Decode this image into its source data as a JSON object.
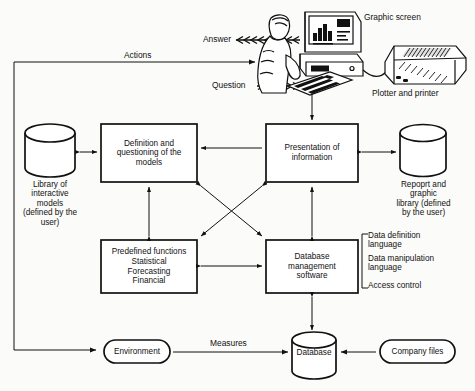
{
  "diagram": {
    "background_color": "#fbfbf9",
    "line_color": "#1a1a1a",
    "boxes": [
      {
        "id": "definition",
        "label": "Definition and\nquestioning of the\nmodels"
      },
      {
        "id": "presentation",
        "label": "Presentation of\ninformation"
      },
      {
        "id": "predefined",
        "label": "Predefined functions\nStatistical\nForecasting\nFinancial"
      },
      {
        "id": "dbms",
        "label": "Database\nmanagement\nsoftware"
      }
    ],
    "cylinders": [
      {
        "id": "model-library",
        "label": "Library of\ninteractive\nmodels\n(defined by the\nuser)"
      },
      {
        "id": "report-library",
        "label": "Repoprt and\ngraphic\nlibrary (defined\nby the user)"
      },
      {
        "id": "database",
        "label": "Database"
      }
    ],
    "rounded_nodes": [
      {
        "id": "environment",
        "label": "Environment"
      },
      {
        "id": "company-files",
        "label": "Company files"
      }
    ],
    "edge_labels": [
      {
        "id": "actions",
        "label": "Actions"
      },
      {
        "id": "answer",
        "label": "Answer"
      },
      {
        "id": "question",
        "label": "Question"
      },
      {
        "id": "measures",
        "label": "Measures"
      }
    ],
    "illustration_labels": [
      {
        "id": "graphic-screen",
        "label": "Graphic screen"
      },
      {
        "id": "plotter-printer",
        "label": "Plotter and printer"
      }
    ],
    "dbms_features": [
      "Data definition\nlanguage",
      "Data manipulation\nlanguage",
      "Access control"
    ]
  }
}
